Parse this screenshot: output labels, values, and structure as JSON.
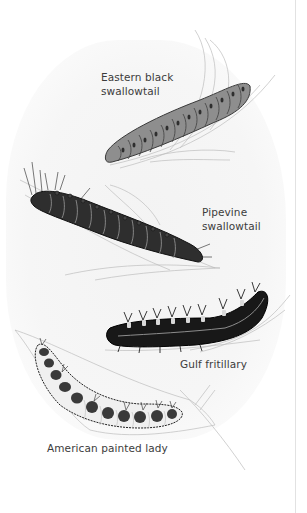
{
  "illustration": {
    "subject": "Butterfly caterpillars on leaves",
    "caterpillars": [
      {
        "id": "eastern-black-swallowtail",
        "label_line1": "Eastern black",
        "label_line2": "swallowtail",
        "body_color": "#8a8a8a",
        "marking_color": "#2e2e2e"
      },
      {
        "id": "pipevine-swallowtail",
        "label_line1": "Pipevine",
        "label_line2": "swallowtail",
        "body_color": "#2b2b2b",
        "marking_color": "#9a9a9a"
      },
      {
        "id": "gulf-fritillary",
        "label_line1": "Gulf fritillary",
        "body_color": "#161616",
        "marking_color": "#d9d9d9"
      },
      {
        "id": "american-painted-lady",
        "label_line1": "American painted lady",
        "body_color": "#3a3a3a",
        "marking_color": "#e6e6e6"
      }
    ]
  },
  "colors": {
    "background": "#ffffff",
    "label_text": "#3c3c3c",
    "leaf_line": "#b5b5b5"
  }
}
